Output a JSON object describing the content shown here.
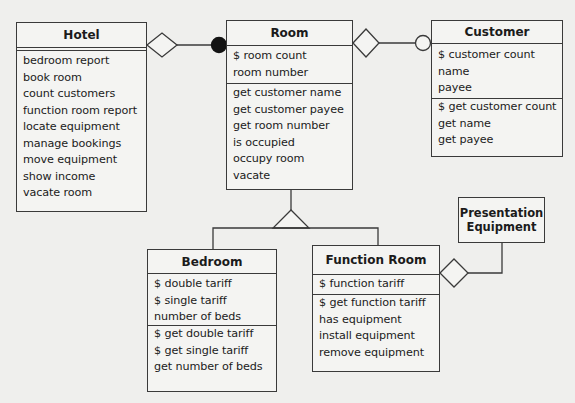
{
  "diagram": {
    "type": "uml-class-diagram",
    "classes": {
      "hotel": {
        "name": "Hotel",
        "attributes": [],
        "operations": [
          "bedroom report",
          "book room",
          "count customers",
          "function room report",
          "locate equipment",
          "manage bookings",
          "move equipment",
          "show income",
          "vacate room"
        ]
      },
      "room": {
        "name": "Room",
        "attributes": [
          "$ room count",
          "room number"
        ],
        "operations": [
          "get customer name",
          "get customer payee",
          "get room number",
          "is occupied",
          "occupy room",
          "vacate"
        ]
      },
      "customer": {
        "name": "Customer",
        "attributes": [
          "$ customer count",
          "name",
          "payee"
        ],
        "operations": [
          "$ get customer count",
          "get name",
          "get payee"
        ]
      },
      "bedroom": {
        "name": "Bedroom",
        "attributes": [
          "$ double tariff",
          "$ single tariff",
          "number of beds"
        ],
        "operations": [
          "$ get double tariff",
          "$ get single tariff",
          "get number of beds"
        ]
      },
      "function_room": {
        "name": "Function Room",
        "attributes": [
          "$ function tariff"
        ],
        "operations": [
          "$ get function tariff",
          "has equipment",
          "install equipment",
          "remove equipment"
        ]
      },
      "presentation_equipment": {
        "name_line1": "Presentation",
        "name_line2": "Equipment"
      }
    },
    "relationships": [
      {
        "from": "Hotel",
        "to": "Room",
        "kind": "aggregation",
        "end_marker": "filled-circle (many)"
      },
      {
        "from": "Room",
        "to": "Customer",
        "kind": "aggregation",
        "end_marker": "open-circle (optional)"
      },
      {
        "from": "Room",
        "to": [
          "Bedroom",
          "Function Room"
        ],
        "kind": "generalization"
      },
      {
        "from": "Function Room",
        "to": "Presentation Equipment",
        "kind": "aggregation"
      }
    ]
  }
}
